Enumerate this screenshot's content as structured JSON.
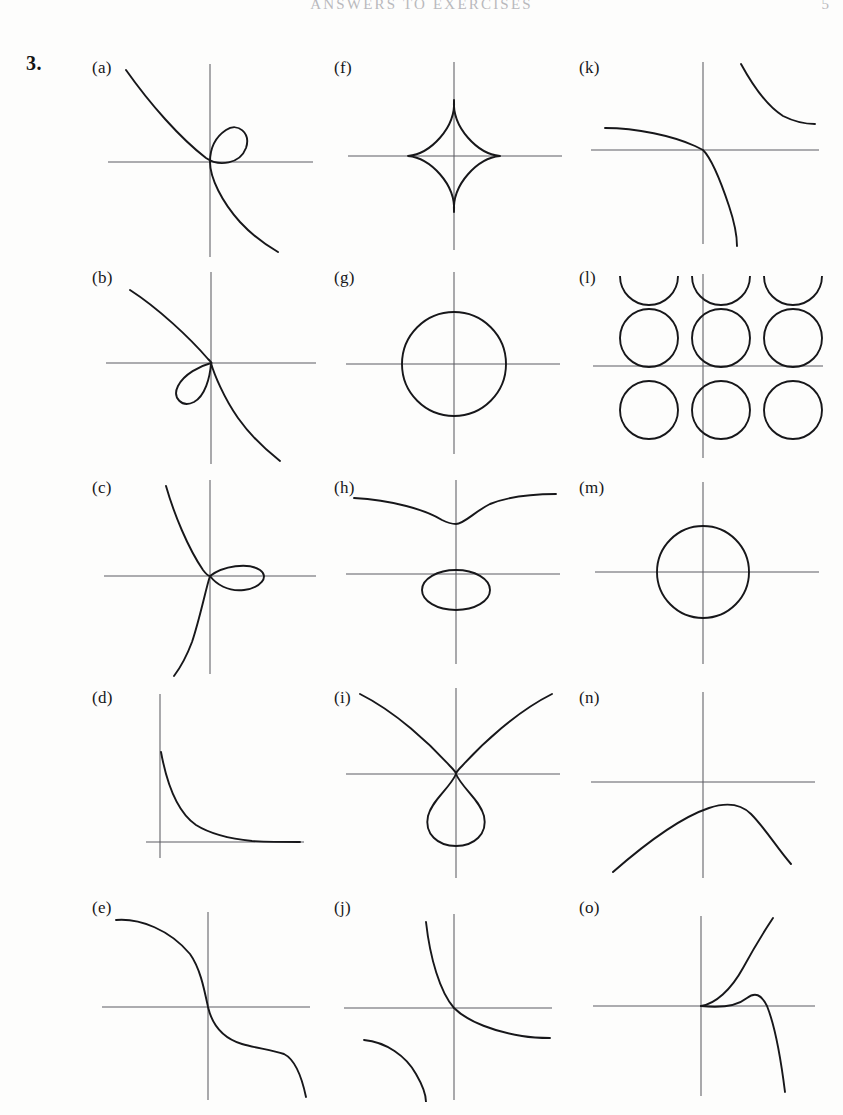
{
  "header": {
    "running_head": "ANSWERS TO EXERCISES",
    "folio": "5"
  },
  "exercise": {
    "number": "3."
  },
  "figures": [
    {
      "id": "a",
      "label": "(a)",
      "col": 0,
      "row": 0,
      "description": "nodal cubic with loop in first quadrant, branch from upper-left to lower-right"
    },
    {
      "id": "b",
      "label": "(b)",
      "col": 0,
      "row": 1,
      "description": "nodal cubic with loop in third quadrant, branch from upper-left to lower-right"
    },
    {
      "id": "c",
      "label": "(c)",
      "col": 0,
      "row": 2,
      "description": "nodal cubic with horizontal loop on positive x-axis, steep branch through origin"
    },
    {
      "id": "d",
      "label": "(d)",
      "col": 0,
      "row": 3,
      "description": "decaying curve in first quadrant only, asymptotic to both axes"
    },
    {
      "id": "e",
      "label": "(e)",
      "col": 0,
      "row": 4,
      "description": "decreasing S-shaped curve through origin"
    },
    {
      "id": "f",
      "label": "(f)",
      "col": 1,
      "row": 0,
      "description": "astroid, four cusped star centred at origin, taller than wide"
    },
    {
      "id": "g",
      "label": "(g)",
      "col": 1,
      "row": 1,
      "description": "circle centred at the origin"
    },
    {
      "id": "h",
      "label": "(h)",
      "col": 1,
      "row": 2,
      "description": "elliptic curve: dipping branch above the x-axis and an oval below it"
    },
    {
      "id": "i",
      "label": "(i)",
      "col": 1,
      "row": 3,
      "description": "curve with teardrop loop below origin and two branches rising left and right"
    },
    {
      "id": "j",
      "label": "(j)",
      "col": 1,
      "row": 4,
      "description": "hyperbola-like branch through origin plus separate arc in third quadrant"
    },
    {
      "id": "k",
      "label": "(k)",
      "col": 2,
      "row": 0,
      "description": "decreasing branch through origin plus separate hyperbolic arc in first quadrant"
    },
    {
      "id": "l",
      "label": "(l)",
      "col": 2,
      "row": 1,
      "description": "doubly periodic lattice of circles clipped by the frame"
    },
    {
      "id": "m",
      "label": "(m)",
      "col": 2,
      "row": 2,
      "description": "circle centred at the origin, larger radius"
    },
    {
      "id": "n",
      "label": "(n)",
      "col": 2,
      "row": 3,
      "description": "concave down arc lying below the x-axis with maximum near the y-axis"
    },
    {
      "id": "o",
      "label": "(o)",
      "col": 2,
      "row": 4,
      "description": "two branches from the origin: one rising steeply, one peaking then plunging"
    }
  ]
}
